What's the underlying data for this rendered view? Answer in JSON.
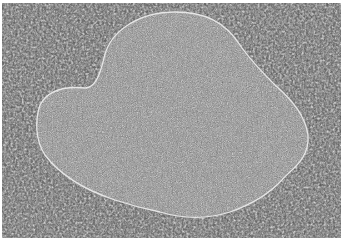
{
  "image": {
    "description": "Grayscale speckle-noise micrograph with a large textured blob region outlined by a thin bright contour",
    "width": 344,
    "height": 241,
    "colors": {
      "background_dark": "#1a1a1a",
      "background_light": "#e8e8e8",
      "blob_fill": "#8a8a8a",
      "contour": "#dddddd",
      "border": "#ffffff"
    }
  }
}
